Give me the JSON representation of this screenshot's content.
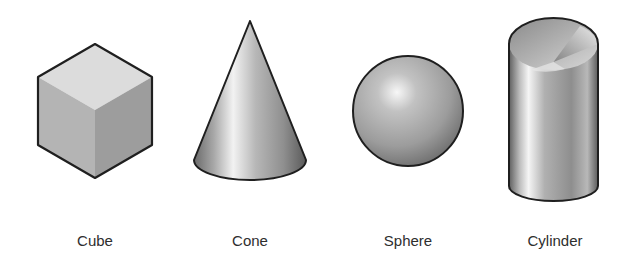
{
  "figure": {
    "shapes": [
      {
        "id": "cube",
        "label": "Cube",
        "center_x": 95
      },
      {
        "id": "cone",
        "label": "Cone",
        "center_x": 250
      },
      {
        "id": "sphere",
        "label": "Sphere",
        "center_x": 408
      },
      {
        "id": "cylinder",
        "label": "Cylinder",
        "center_x": 555
      }
    ],
    "colors": {
      "outline": "#1f1f1f",
      "cube_top": "#dcdcdc",
      "cube_left": "#b4b4b4",
      "cube_right": "#9a9a9a",
      "metal_light": "#f0f0f0",
      "metal_mid": "#a8a8a8",
      "metal_dark": "#5e5e5e",
      "label_text": "#2e2e2e",
      "background": "#ffffff"
    }
  }
}
